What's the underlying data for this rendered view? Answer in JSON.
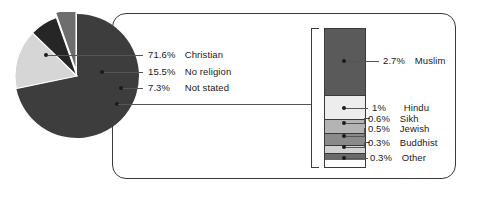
{
  "chart_data": {
    "type": "pie",
    "title": "",
    "subtitle": "",
    "xlabel": "",
    "ylabel": "",
    "legend_position": "right-of-pie",
    "grid": false,
    "units": "percent",
    "categories": [
      "Christian",
      "No religion",
      "Not stated",
      "Other religions"
    ],
    "values": [
      71.6,
      15.5,
      7.3,
      5.4
    ],
    "labels": [
      "71.6% Christian",
      "15.5% No religion",
      "7.3% Not stated",
      ""
    ],
    "breakout": {
      "type": "bar",
      "orientation": "vertical-stacked",
      "of_category": "Other religions",
      "categories": [
        "Muslim",
        "Hindu",
        "Sikh",
        "Jewish",
        "Buddhist",
        "Other"
      ],
      "values": [
        2.7,
        1.0,
        0.6,
        0.5,
        0.3,
        0.3
      ]
    }
  },
  "pie": {
    "slices": [
      {
        "name": "Christian",
        "pct_label": "71.6%",
        "label": "Christian",
        "value": 71.6,
        "color": "#3d3d3d"
      },
      {
        "name": "No religion",
        "pct_label": "15.5%",
        "label": "No religion",
        "value": 15.5,
        "color": "#d6d6d6"
      },
      {
        "name": "Not stated",
        "pct_label": "7.3%",
        "label": "Not stated",
        "value": 7.3,
        "color": "#262626"
      },
      {
        "name": "Other",
        "pct_label": "",
        "label": "",
        "value": 5.4,
        "color": "#6e6e6e"
      }
    ]
  },
  "breakout_bar": {
    "segments": [
      {
        "name": "Muslim",
        "pct_label": "2.7%",
        "label": "Muslim",
        "value": 2.7,
        "color": "#5a5a5a"
      },
      {
        "name": "Hindu",
        "pct_label": "1%",
        "label": "Hindu",
        "value": 1.0,
        "color": "#ededed"
      },
      {
        "name": "Sikh",
        "pct_label": "0.6%",
        "label": "Sikh",
        "value": 0.6,
        "color": "#b4b4b4"
      },
      {
        "name": "Jewish",
        "pct_label": "0.5%",
        "label": "Jewish",
        "value": 0.5,
        "color": "#8a8a8a"
      },
      {
        "name": "Buddhist",
        "pct_label": "0.3%",
        "label": "Buddhist",
        "value": 0.3,
        "color": "#d2d2d2"
      },
      {
        "name": "Other",
        "pct_label": "0.3%",
        "label": "Other",
        "value": 0.3,
        "color": "#6b6b6b"
      }
    ]
  },
  "colors": {
    "line": "#555555",
    "outline": "#3a3a3a",
    "text": "#1a1a1a",
    "background": "#ffffff"
  }
}
